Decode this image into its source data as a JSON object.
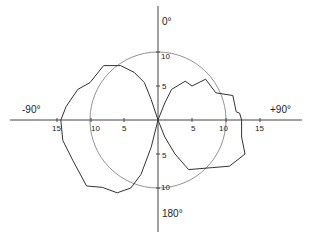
{
  "chart_data": {
    "type": "polar",
    "title": "",
    "angle_labels": {
      "top": "0°",
      "right": "+90°",
      "bottom": "180°",
      "left": "-90°"
    },
    "radial_ticks": {
      "horizontal_left": [
        "15",
        "10",
        "5"
      ],
      "horizontal_right": [
        "5",
        "10",
        "15"
      ],
      "vertical_top": [
        "10",
        "5"
      ],
      "vertical_bottom": [
        "5",
        "10"
      ]
    },
    "reference_circle_radius": 10,
    "series": [
      {
        "name": "left-lobe",
        "points_xy": [
          [
            0,
            0
          ],
          [
            -1,
            3
          ],
          [
            -2,
            5.5
          ],
          [
            -3.5,
            7
          ],
          [
            -5.5,
            8
          ],
          [
            -8,
            8
          ],
          [
            -10,
            5.5
          ],
          [
            -11.8,
            4.5
          ],
          [
            -13.5,
            2
          ],
          [
            -14.3,
            0
          ],
          [
            -14,
            -3
          ],
          [
            -12.5,
            -6
          ],
          [
            -10.5,
            -9.7
          ],
          [
            -8.2,
            -9.9
          ],
          [
            -6,
            -10.7
          ],
          [
            -4,
            -10
          ],
          [
            -2.5,
            -8
          ],
          [
            -1,
            -4
          ],
          [
            0,
            0
          ]
        ]
      },
      {
        "name": "right-lobe",
        "points_xy": [
          [
            0,
            0
          ],
          [
            1,
            2.5
          ],
          [
            2,
            4.5
          ],
          [
            4,
            5.7
          ],
          [
            5,
            5
          ],
          [
            7,
            6
          ],
          [
            8.5,
            4
          ],
          [
            11,
            3.6
          ],
          [
            11.5,
            1.2
          ],
          [
            12,
            1
          ],
          [
            12.3,
            0
          ],
          [
            12.3,
            -2.5
          ],
          [
            12.8,
            -5
          ],
          [
            10.5,
            -6.8
          ],
          [
            8,
            -7
          ],
          [
            4.5,
            -7.3
          ],
          [
            2.5,
            -5
          ],
          [
            1,
            -2.5
          ],
          [
            0,
            0
          ]
        ]
      }
    ],
    "grid": false,
    "legend": null
  }
}
